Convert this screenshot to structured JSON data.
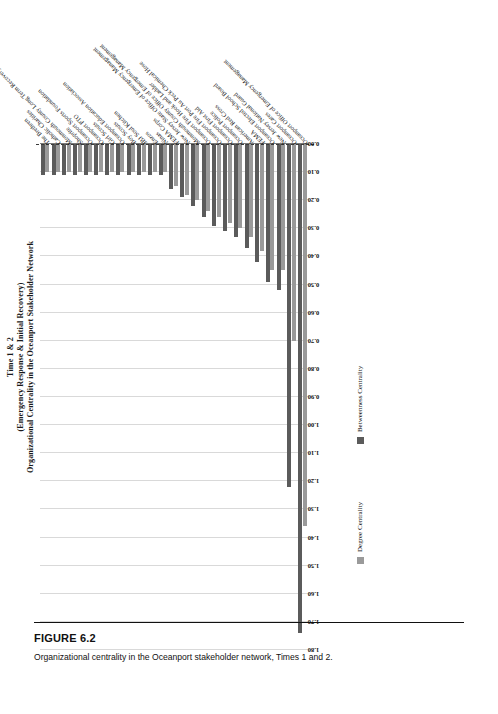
{
  "figure": {
    "number": "FIGURE 6.2",
    "caption": "Organizational centrality in the Oceanport stakeholder network, Times 1 and 2."
  },
  "title": {
    "line1": "Time 1 & 2",
    "line2": "(Emergency Response & Initial Recovery)",
    "line3": "Organizational Centrality in the Oceanport Stakeholder Network"
  },
  "legend": {
    "series1_label": "Degree Centrality",
    "series2_label": "Betweenness Centrality",
    "series1_color": "#9a9a9a",
    "series2_color": "#5b5b5b"
  },
  "axis": {
    "ticks": [
      "1.80",
      "1.70",
      "1.60",
      "1.50",
      "1.40",
      "1.30",
      "1.20",
      "1.10",
      "1.00",
      "0.90",
      "0.80",
      "0.70",
      "0.60",
      "0.50",
      "0.40",
      "0.30",
      "0.20",
      "0.10",
      "0.00"
    ],
    "min": 0.0,
    "max": 1.8,
    "step": 0.1
  },
  "chart_data": {
    "type": "bar",
    "orientation": "horizontal",
    "title": "Time 1 & 2 (Emergency Response & Initial Recovery) Organizational Centrality in the Oceanport Stakeholder Network",
    "xlabel": "",
    "ylabel": "",
    "xlim": [
      0.0,
      1.8
    ],
    "grid": true,
    "legend_position": "bottom",
    "categories": [
      "Oceanport Office of Emergency Management",
      "Oceanport Cares",
      "New Jersey National Guard",
      "Oceanport Elected School Board",
      "FEMA",
      "American Red Cross",
      "Oceanport Police",
      "Oceanport First Aid",
      "Oceanport Fire Port Au Peck Chemical Hose",
      "Oceanport Fire Hook and Ladder",
      "Monmouth County Office of Emergency Management",
      "New Jersey State Office of Emergency Management",
      "FEMA Corps",
      "Ninas",
      "Enzos",
      "JBJ Soul Kitchen",
      "Boy Scouts",
      "Oceanport Education Association",
      "Girl Scouts",
      "Oceanport PTO",
      "Oceanport Sports Foundation",
      "Shoprite",
      "Monmouth County Long Term Recovery Group (MCLTRG)",
      "Catholic Charities",
      "The Brethren"
    ],
    "series": [
      {
        "name": "Degree Centrality",
        "color": "#9a9a9a",
        "values": [
          1.36,
          0.7,
          0.45,
          0.45,
          0.38,
          0.33,
          0.3,
          0.28,
          0.26,
          0.24,
          0.2,
          0.18,
          0.15,
          0.1,
          0.1,
          0.1,
          0.1,
          0.1,
          0.1,
          0.1,
          0.1,
          0.1,
          0.1,
          0.1,
          0.1
        ]
      },
      {
        "name": "Betweenness Centrality",
        "color": "#5b5b5b",
        "values": [
          1.74,
          1.22,
          0.52,
          0.49,
          0.42,
          0.37,
          0.33,
          0.31,
          0.29,
          0.26,
          0.22,
          0.19,
          0.16,
          0.11,
          0.11,
          0.11,
          0.11,
          0.11,
          0.11,
          0.11,
          0.11,
          0.11,
          0.11,
          0.11,
          0.11
        ]
      }
    ]
  }
}
